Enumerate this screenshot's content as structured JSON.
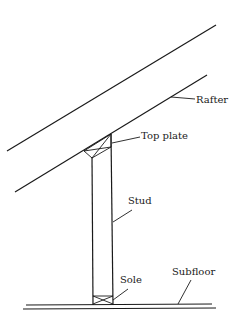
{
  "diagram": {
    "type": "framing-section",
    "labels": {
      "rafter": "Rafter",
      "top_plate": "Top plate",
      "stud": "Stud",
      "sole": "Sole",
      "subfloor": "Subfloor"
    },
    "colors": {
      "line": "#1a1a1a",
      "background": "#ffffff"
    }
  }
}
